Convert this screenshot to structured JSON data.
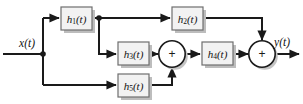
{
  "diagram": {
    "type": "signal-flow-block-diagram",
    "colors": {
      "wire": "#1a1a1a",
      "block_fill": "#f2f2f2",
      "block_stroke": "#6e6e6e",
      "shadow": "#bdbdbd",
      "background": "#ffffff",
      "text": "#111111"
    },
    "input_signal": {
      "name": "x(t)",
      "base": "x",
      "arg": "(t)"
    },
    "output_signal": {
      "name": "y(t)",
      "base": "y",
      "arg": "(t)"
    },
    "blocks": [
      {
        "id": "h1",
        "base": "h",
        "sub": "1",
        "arg": "(t)",
        "label": "h1(t)"
      },
      {
        "id": "h2",
        "base": "h",
        "sub": "2",
        "arg": "(t)",
        "label": "h2(t)"
      },
      {
        "id": "h3",
        "base": "h",
        "sub": "3",
        "arg": "(t)",
        "label": "h3(t)"
      },
      {
        "id": "h4",
        "base": "h",
        "sub": "4",
        "arg": "(t)",
        "label": "h4(t)"
      },
      {
        "id": "h5",
        "base": "h",
        "sub": "5",
        "arg": "(t)",
        "label": "h5(t)"
      }
    ],
    "summers": [
      {
        "id": "sum1",
        "symbol": "+"
      },
      {
        "id": "sum2",
        "symbol": "+"
      }
    ],
    "junctions": [
      {
        "id": "input-split",
        "label": "x(t) split node"
      },
      {
        "id": "h1-split",
        "label": "h1 output split node"
      }
    ]
  }
}
